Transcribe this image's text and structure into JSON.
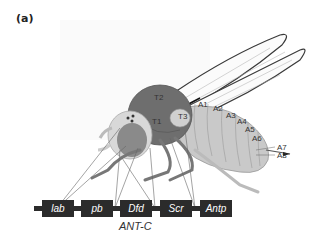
{
  "figure": {
    "panel_label": "(a)"
  },
  "segments": {
    "thorax": [
      "T1",
      "T2",
      "T3"
    ],
    "abdomen": [
      "A1",
      "A2",
      "A3",
      "A4",
      "A5",
      "A6",
      "A7",
      "A8"
    ]
  },
  "labels": {
    "T1": "T1",
    "T2": "T2",
    "T3": "T3",
    "A1": "A1",
    "A2": "A2",
    "A3": "A3",
    "A4": "A4",
    "A5": "A5",
    "A6": "A6",
    "A7": "A7",
    "A8": "A8"
  },
  "gene_complex": {
    "name": "ANT-C",
    "genes": [
      "lab",
      "pb",
      "Dfd",
      "Scr",
      "Antp"
    ]
  },
  "genes": {
    "g0": "lab",
    "g1": "pb",
    "g2": "Dfd",
    "g3": "Scr",
    "g4": "Antp"
  },
  "colors": {
    "background": "#ffffff",
    "gene_box": "#2b2b2b",
    "thorax": "#6e6e6e",
    "abdomen": "#c9c9c9",
    "head": "#d8d8d8",
    "eye": "#8a8a8a",
    "wing_outline": "#3a3a3a"
  }
}
